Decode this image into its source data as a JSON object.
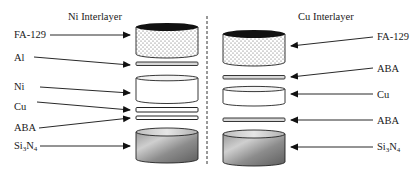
{
  "diagram": {
    "type": "layer-stack-comparison",
    "divider": "dashed-vertical-line",
    "left_panel": {
      "title": "Ni Interlayer",
      "layers": [
        {
          "label": "FA-129",
          "shape": "cylinder",
          "fill": "dotted",
          "cap": "black"
        },
        {
          "label": "Al",
          "shape": "thin-disc",
          "fill": "light-gray"
        },
        {
          "label": "Ni",
          "shape": "cylinder",
          "fill": "white"
        },
        {
          "label": "Cu",
          "shape": "thin-disc",
          "fill": "white"
        },
        {
          "label": "ABA",
          "shape": "thin-disc",
          "fill": "white"
        },
        {
          "label_main": "Si",
          "label_sub1": "3",
          "label_mid": "N",
          "label_sub2": "4",
          "label": "Si3N4",
          "shape": "cylinder",
          "fill": "gray-gradient"
        }
      ]
    },
    "right_panel": {
      "title": "Cu Interlayer",
      "layers": [
        {
          "label": "FA-129",
          "shape": "cylinder",
          "fill": "dotted",
          "cap": "black"
        },
        {
          "label": "ABA",
          "shape": "thin-disc",
          "fill": "light-gray"
        },
        {
          "label": "Cu",
          "shape": "cylinder",
          "fill": "white"
        },
        {
          "label": "ABA",
          "shape": "thin-disc",
          "fill": "light-gray"
        },
        {
          "label_main": "Si",
          "label_sub1": "3",
          "label_mid": "N",
          "label_sub2": "4",
          "label": "Si3N4",
          "shape": "cylinder",
          "fill": "gray-gradient"
        }
      ]
    },
    "colors": {
      "ink": "#1a1a1a",
      "cap": "#111111",
      "dots": "#555555",
      "thin_disc": "#d8d8d8",
      "ceramic_light": "#c9c9c9",
      "ceramic_dark": "#6a6a6a"
    }
  }
}
